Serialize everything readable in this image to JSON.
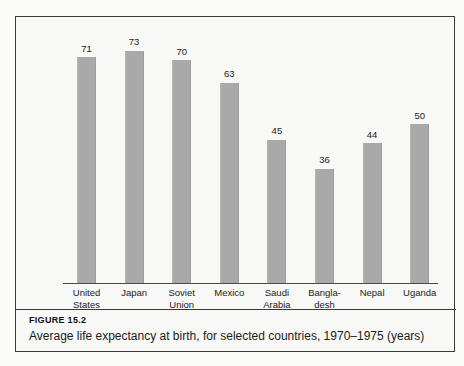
{
  "figure": {
    "number_label": "FIGURE 15.2",
    "caption": "Average life expectancy at birth, for selected countries, 1970–1975 (years)"
  },
  "colors": {
    "bar_fill": "#a9a9a9",
    "frame": "#3a3a3a",
    "axis": "#4a4a4a",
    "text": "#1b1b1b",
    "page_background": "#fbfbf9",
    "figure_background": "#f8f8f6"
  },
  "chart_data": {
    "type": "bar",
    "title": "Average life expectancy at birth, for selected countries, 1970–1975 (years)",
    "xlabel": "",
    "ylabel": "",
    "ylim": [
      0,
      80
    ],
    "grid": false,
    "legend": "none",
    "value_labels": true,
    "categories": [
      "United States",
      "Japan",
      "Soviet Union",
      "Mexico",
      "Saudi Arabia",
      "Bangladesh",
      "Nepal",
      "Uganda"
    ],
    "values": [
      71,
      73,
      70,
      63,
      45,
      36,
      44,
      50
    ],
    "bars": [
      {
        "category": "United States",
        "label_line1": "United",
        "label_line2": "States",
        "value": 71,
        "value_text": "71"
      },
      {
        "category": "Japan",
        "label_line1": "Japan",
        "label_line2": "",
        "value": 73,
        "value_text": "73"
      },
      {
        "category": "Soviet Union",
        "label_line1": "Soviet",
        "label_line2": "Union",
        "value": 70,
        "value_text": "70"
      },
      {
        "category": "Mexico",
        "label_line1": "Mexico",
        "label_line2": "",
        "value": 63,
        "value_text": "63"
      },
      {
        "category": "Saudi Arabia",
        "label_line1": "Saudi",
        "label_line2": "Arabia",
        "value": 45,
        "value_text": "45"
      },
      {
        "category": "Bangladesh",
        "label_line1": "Bangla-",
        "label_line2": "desh",
        "value": 36,
        "value_text": "36"
      },
      {
        "category": "Nepal",
        "label_line1": "Nepal",
        "label_line2": "",
        "value": 44,
        "value_text": "44"
      },
      {
        "category": "Uganda",
        "label_line1": "Uganda",
        "label_line2": "",
        "value": 50,
        "value_text": "50"
      }
    ]
  }
}
